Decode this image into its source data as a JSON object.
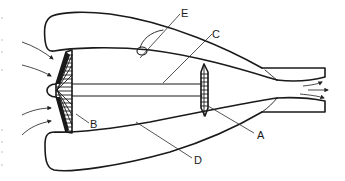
{
  "diagram": {
    "background": "#ffffff",
    "line_color": "#1a1a1a",
    "labels": [
      {
        "id": "A",
        "text": "A",
        "points_to": "turbine"
      },
      {
        "id": "B",
        "text": "B",
        "points_to": "fan"
      },
      {
        "id": "C",
        "text": "C",
        "points_to": "shaft"
      },
      {
        "id": "D",
        "text": "D",
        "points_to": "bypass-duct"
      },
      {
        "id": "E",
        "text": "E",
        "points_to": "nacelle-component"
      }
    ],
    "components": [
      "upper-nacelle",
      "lower-nacelle",
      "fan",
      "nose-cone",
      "shaft",
      "turbine",
      "exhaust-nozzle",
      "inlet-arrows",
      "exhaust-arrows"
    ],
    "inlet_arrow_count": 4,
    "exhaust_arrow_count": 3
  }
}
